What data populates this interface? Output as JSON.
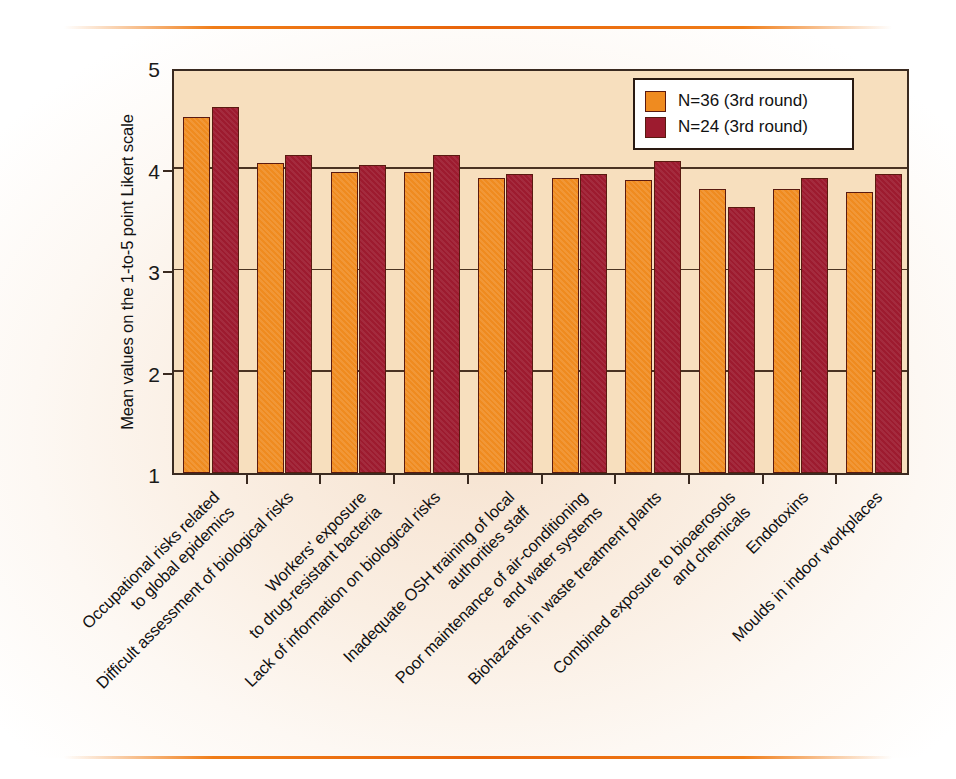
{
  "chart_data": {
    "type": "bar",
    "title": "",
    "xlabel": "",
    "ylabel": "Mean values on the 1-to-5 point Likert scale",
    "ylim": [
      1,
      5
    ],
    "yticks": [
      1,
      2,
      3,
      4,
      5
    ],
    "grid": true,
    "legend_position": "top-right",
    "categories": [
      "Occupational risks related\nto global epidemics",
      "Difficult assessment of biological risks",
      "Workers' exposure\nto drug-resistant bacteria",
      "Lack of information on biological risks",
      "Inadequate OSH training of local\nauthorities staff",
      "Poor maintenance of air-conditioning\nand water systems",
      "Biohazards in waste treatment plants",
      "Combined exposure to bioaerosols\nand chemicals",
      "Endotoxins",
      "Moulds in indoor workplaces"
    ],
    "series": [
      {
        "name": "N=36 (3rd round)",
        "color": "#ef8b20",
        "values": [
          4.51,
          4.05,
          3.97,
          3.97,
          3.91,
          3.91,
          3.89,
          3.8,
          3.8,
          3.77
        ]
      },
      {
        "name": "N=24 (3rd round)",
        "color": "#9d1b2f",
        "values": [
          4.61,
          4.13,
          4.03,
          4.13,
          3.95,
          3.95,
          4.07,
          3.62,
          3.91,
          3.95
        ]
      }
    ]
  },
  "legend": {
    "items": [
      {
        "label": "N=36 (3rd round)",
        "color": "#ef8b20"
      },
      {
        "label": "N=24 (3rd round)",
        "color": "#9d1b2f"
      }
    ]
  },
  "colors": {
    "series_1": "#ef8b20",
    "series_2": "#9d1b2f",
    "plot_background": "#f7dfbe",
    "axis": "#3a2a20",
    "rule": "#e8630a"
  }
}
